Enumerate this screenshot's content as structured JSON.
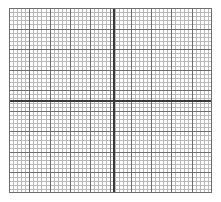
{
  "figure": {
    "title": "",
    "background_color": "#ffffff",
    "width": 221,
    "height": 202
  },
  "plot": {
    "left": 9,
    "top": 8,
    "width": 203,
    "height": 185,
    "background_color": "#ffffff",
    "border_color": "#6e6e6e"
  },
  "grid": {
    "minor_color": "#b9b9b9",
    "major_color": "#6e6e6e",
    "axis_color": "#3a3a3a",
    "minor_step_x_px": 4.06,
    "minor_step_y_px": 4.11,
    "major_step_x_px": 20.3,
    "major_step_y_px": 20.55,
    "minor_per_major": 5
  },
  "axes": {
    "x_axis_y_px": 92,
    "y_axis_x_px": 104
  },
  "chart_data": {
    "type": "line",
    "title": "",
    "subtitle": "",
    "xlabel": "",
    "ylabel": "",
    "grid": "on",
    "grid_style": "graph-paper",
    "legend": "none",
    "annotations": [],
    "tick_labels_x": [],
    "tick_labels_y": [],
    "xlim": [
      -26,
      24
    ],
    "ylim": [
      -22,
      23
    ],
    "x_major_ticks": 10,
    "y_major_ticks": 9,
    "x_minor_per_major": 5,
    "y_minor_per_major": 5,
    "series": [],
    "x": [],
    "values": [],
    "note": "Blank Cartesian graph-paper grid; no plotted data, tick labels, legend or annotations are rendered."
  }
}
